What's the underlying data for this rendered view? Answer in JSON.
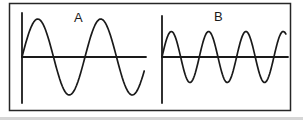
{
  "figure": {
    "background_color": "#ffffff",
    "line_color": "#1a1a1a",
    "border_color": "#262626",
    "bottom_edge_color": "#d6d6d6",
    "panels": [
      {
        "label": "A",
        "cycles": 1.94,
        "period": 63,
        "amplitude": 38
      },
      {
        "label": "B",
        "cycles": 3.32,
        "period": 37.3,
        "amplitude": 25.5
      }
    ]
  }
}
